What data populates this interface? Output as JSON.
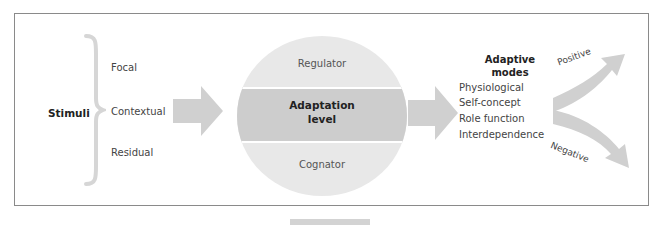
{
  "diagram": {
    "stimuli": {
      "title": "Stimuli",
      "items": [
        "Focal",
        "Contextual",
        "Residual"
      ]
    },
    "processor": {
      "top": "Regulator",
      "middle_line1": "Adaptation",
      "middle_line2": "level",
      "bottom": "Cognator"
    },
    "adaptive_modes": {
      "title_line1": "Adaptive",
      "title_line2": "modes",
      "items": [
        "Physiological",
        "Self-concept",
        "Role function",
        "Interdependence"
      ]
    },
    "outcomes": {
      "positive": "Positive",
      "negative": "Negative"
    },
    "colors": {
      "arrow": "#d0d0d0",
      "circle": "#e8e8e8",
      "band": "#cdcdcd",
      "brace": "#d6d6d6",
      "frame": "#8a8a8a"
    }
  }
}
